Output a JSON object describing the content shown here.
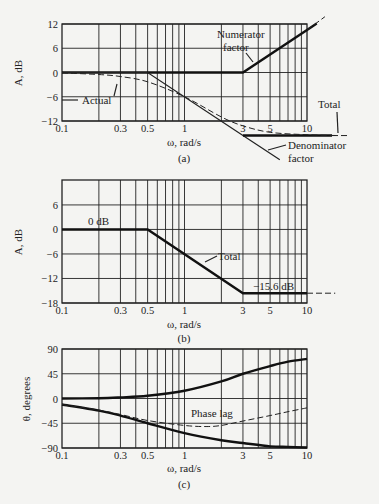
{
  "chart_data": [
    {
      "id": "a",
      "type": "line",
      "caption": "(a)",
      "xlabel": "ω, rad/s",
      "ylabel": "A, dB",
      "xscale": "log",
      "xlim": [
        0.1,
        10
      ],
      "ylim": [
        -12,
        12
      ],
      "xticks": [
        "0.1",
        "0.3",
        "0.5",
        "1",
        "3",
        "5",
        "10"
      ],
      "yticks": [
        "12",
        "6",
        "0",
        "−6",
        "−12"
      ],
      "grid": true,
      "series": [
        {
          "name": "Numerator factor",
          "style": "solid-thick",
          "x": [
            0.1,
            3,
            10,
            12
          ],
          "y": [
            0,
            0,
            10.5,
            12.1
          ]
        },
        {
          "name": "Denominator factor",
          "style": "solid-thin",
          "x": [
            0.1,
            0.5,
            3,
            6
          ],
          "y": [
            0,
            0,
            -15.6,
            -21.6
          ]
        },
        {
          "name": "Total",
          "style": "solid-thick",
          "x": [
            3,
            10,
            16
          ],
          "y": [
            -15.6,
            -15.6,
            -15.6
          ]
        },
        {
          "name": "Actual",
          "style": "dashed",
          "x": [
            0.1,
            0.2,
            0.3,
            0.5,
            1,
            2,
            3,
            5,
            10,
            18
          ],
          "y": [
            -0.1,
            -0.5,
            -1.0,
            -2.3,
            -6.0,
            -11.0,
            -13.2,
            -14.8,
            -15.4,
            -15.6
          ]
        }
      ],
      "annotations": [
        "Numerator factor",
        "Actual",
        "Total",
        "Denominator factor"
      ]
    },
    {
      "id": "b",
      "type": "line",
      "caption": "(b)",
      "xlabel": "ω, rad/s",
      "ylabel": "A, dB",
      "xscale": "log",
      "xlim": [
        0.1,
        10
      ],
      "ylim": [
        -18,
        12
      ],
      "xticks": [
        "0.1",
        "0.3",
        "0.5",
        "1",
        "3",
        "5",
        "10"
      ],
      "yticks": [
        "6",
        "0",
        "−6",
        "−12",
        "−18"
      ],
      "grid": true,
      "series": [
        {
          "name": "Total",
          "style": "solid-thick",
          "x": [
            0.1,
            0.5,
            3,
            10
          ],
          "y": [
            0,
            0,
            -15.6,
            -15.6
          ]
        }
      ],
      "annotations": [
        "0 dB",
        "Total",
        "−15.6 dB"
      ]
    },
    {
      "id": "c",
      "type": "line",
      "caption": "(c)",
      "xlabel": "ω, rad/s",
      "ylabel": "θ, degrees",
      "xscale": "log",
      "xlim": [
        0.1,
        10
      ],
      "ylim": [
        -90,
        90
      ],
      "xticks": [
        "0.1",
        "0.3",
        "0.5",
        "1",
        "3",
        "5",
        "10"
      ],
      "yticks": [
        "90",
        "45",
        "0",
        "−45",
        "−90"
      ],
      "grid": true,
      "series": [
        {
          "name": "Numerator phase",
          "style": "solid-thick",
          "x": [
            0.1,
            0.2,
            0.3,
            0.5,
            1,
            2,
            3,
            5,
            7,
            10
          ],
          "y": [
            0,
            0.5,
            2,
            5,
            14,
            31,
            45,
            59,
            67,
            72
          ]
        },
        {
          "name": "Denominator phase",
          "style": "solid-thick",
          "x": [
            0.1,
            0.2,
            0.3,
            0.5,
            1,
            2,
            3,
            5,
            7,
            10
          ],
          "y": [
            -11,
            -22,
            -31,
            -45,
            -63,
            -76,
            -81,
            -87,
            -88,
            -89
          ]
        },
        {
          "name": "Phase lag",
          "style": "dashed",
          "x": [
            0.1,
            0.2,
            0.3,
            0.5,
            1,
            1.5,
            2,
            3,
            5,
            7,
            10
          ],
          "y": [
            -11,
            -21,
            -29,
            -40,
            -49,
            -51,
            -49,
            -41,
            -31,
            -24,
            -17
          ]
        }
      ],
      "annotations": [
        "Phase lag"
      ]
    }
  ],
  "labels": {
    "a": {
      "caption": "(a)",
      "xlabel": "ω, rad/s",
      "ylabel": "A, dB",
      "yticks": [
        "12",
        "6",
        "0",
        "−6",
        "−12"
      ],
      "xticks": [
        "0.1",
        "0.3",
        "0.5",
        "1",
        "3",
        "5",
        "10"
      ],
      "numerator_1": "Numerator",
      "numerator_2": "factor",
      "actual": "Actual",
      "total": "Total",
      "denominator_1": "Denominator",
      "denominator_2": "factor"
    },
    "b": {
      "caption": "(b)",
      "xlabel": "ω, rad/s",
      "ylabel": "A, dB",
      "yticks": [
        "6",
        "0",
        "−6",
        "−12",
        "−18"
      ],
      "xticks": [
        "0.1",
        "0.3",
        "0.5",
        "1",
        "3",
        "5",
        "10"
      ],
      "zero_db": "0 dB",
      "total": "Total",
      "final_db": "−15.6 dB"
    },
    "c": {
      "caption": "(c)",
      "xlabel": "ω, rad/s",
      "ylabel": "θ, degrees",
      "yticks": [
        "90",
        "45",
        "0",
        "−45",
        "−90"
      ],
      "xticks": [
        "0.1",
        "0.3",
        "0.5",
        "1",
        "3",
        "5",
        "10"
      ],
      "phase_lag": "Phase lag"
    }
  }
}
